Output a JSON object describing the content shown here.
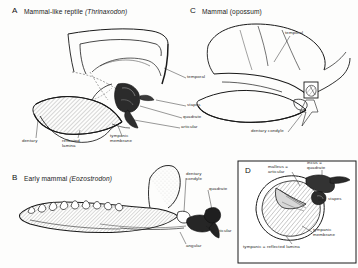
{
  "figure": {
    "background_color": "#fdfdfc",
    "ink_color": "#1a1a1a",
    "hatch_color": "#555555",
    "dark_bone_color": "#2a2a2a"
  },
  "panels": {
    "a": {
      "letter": "A",
      "title": "Mammal-like reptile",
      "taxon": "(Thrinaxodon)",
      "labels": {
        "temporal": "temporal",
        "stapes": "stapes",
        "quadrate": "quadrate",
        "articular": "articular",
        "dentary": "dentary",
        "reflected_lamina": "reflected\nlamina",
        "reflected_lamina_l1": "reflected",
        "reflected_lamina_l2": "lamina",
        "tympanic_membrane_l1": "tympanic",
        "tympanic_membrane_l2": "membrane"
      }
    },
    "b": {
      "letter": "B",
      "title": "Early mammal",
      "taxon": "(Eozostrodon)",
      "labels": {
        "dentary_condyle_l1": "dentary",
        "dentary_condyle_l2": "condyle",
        "quadrate": "quadrate",
        "articular": "articular",
        "angular": "angular"
      }
    },
    "c": {
      "letter": "C",
      "title": "Mammal",
      "taxon": "(opossum)",
      "labels": {
        "temporal": "temporal",
        "dentary_condyle": "dentary condyle"
      }
    },
    "d": {
      "letter": "D",
      "labels": {
        "malleus_articular_l1": "malleus =",
        "malleus_articular_l2": "articular",
        "incus_quadrate_l1": "incus =",
        "incus_quadrate_l2": "quadrate",
        "stapes": "stapes",
        "tympanic_membrane_l1": "tympanic",
        "tympanic_membrane_l2": "membrane",
        "tympanic_reflected_lamina": "tympanic = reflected lamina"
      }
    }
  }
}
